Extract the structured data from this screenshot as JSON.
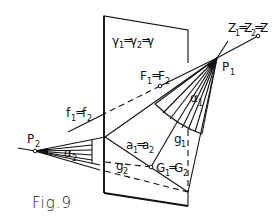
{
  "figure": {
    "caption": "Fig.9",
    "labels": {
      "plane": {
        "main": "γ",
        "parts": [
          "γ₁",
          "γ₂",
          "γ"
        ],
        "text": "γ1=γ2=γ"
      },
      "Z": {
        "text": "Z1=Z2=Z"
      },
      "P1": {
        "main": "P",
        "sub": "1"
      },
      "P2": {
        "main": "P",
        "sub": "2"
      },
      "F": {
        "text": "F1=F2"
      },
      "f": {
        "text": "f1=f2"
      },
      "alpha1": {
        "main": "α",
        "sub": "1"
      },
      "alpha2": {
        "main": "α",
        "sub": "2"
      },
      "a": {
        "text": "a1=a2"
      },
      "g1": {
        "main": "g",
        "sub": "1"
      },
      "g2": {
        "main": "g",
        "sub": "2"
      },
      "G": {
        "text": "G1=G2"
      }
    },
    "points": {
      "P1": [
        217,
        58
      ],
      "P2": [
        35,
        151
      ],
      "Z": [
        258,
        36
      ],
      "F": [
        160,
        86
      ],
      "G": [
        151,
        167
      ],
      "plane_corners": {
        "tl": [
          104,
          16
        ],
        "tr": [
          188,
          30
        ],
        "bl": [
          104,
          193
        ],
        "br": [
          188,
          206
        ]
      }
    }
  }
}
